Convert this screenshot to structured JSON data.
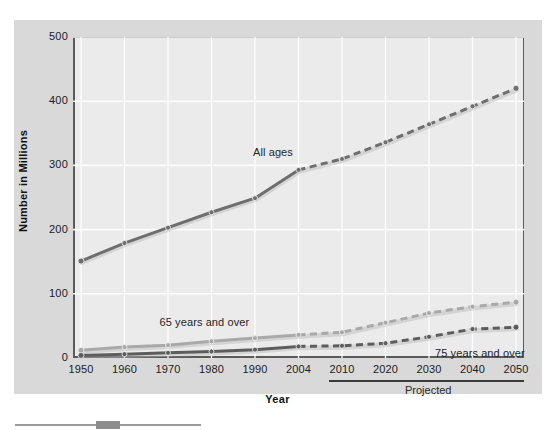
{
  "chart_data": {
    "type": "line",
    "title": "",
    "xlabel": "Year",
    "ylabel": "Number in Millions",
    "ylim": [
      0,
      500
    ],
    "yticks": [
      0,
      100,
      200,
      300,
      400,
      500
    ],
    "categories": [
      "1950",
      "1960",
      "1970",
      "1980",
      "1990",
      "2004",
      "2010",
      "2020",
      "2030",
      "2040",
      "2050"
    ],
    "grid": true,
    "legend_position": "inline-labels",
    "projection_start_category": "2010",
    "projection_note": "Projected",
    "series": [
      {
        "name": "All ages",
        "color": "#6e6e6e",
        "values": [
          151,
          179,
          203,
          227,
          249,
          293,
          310,
          336,
          364,
          392,
          420
        ],
        "label_text": "All ages"
      },
      {
        "name": "65 years and over",
        "color": "#a9a9a9",
        "values": [
          12,
          17,
          20,
          26,
          31,
          36,
          40,
          55,
          70,
          80,
          87
        ],
        "label_text": "65 years and over"
      },
      {
        "name": "75 years and over",
        "color": "#5d5d5d",
        "values": [
          4,
          6,
          8,
          10,
          13,
          18,
          19,
          23,
          33,
          45,
          48
        ],
        "label_text": "75 years and over"
      }
    ],
    "annotations": [
      {
        "text": "All ages",
        "x_category": "1990"
      },
      {
        "text": "65 years and over",
        "x_category": "1980"
      },
      {
        "text": "75 years and over",
        "x_category": "2035"
      },
      {
        "text": "Projected",
        "x_category": "2030"
      }
    ]
  },
  "axes": {
    "y_title": "Number in Millions",
    "x_title": "Year",
    "y_tick_labels": [
      "500",
      "400",
      "300",
      "200",
      "100",
      "0"
    ],
    "x_tick_labels": [
      "1950",
      "1960",
      "1970",
      "1980",
      "1990",
      "2004",
      "2010",
      "2020",
      "2030",
      "2040",
      "2050"
    ]
  },
  "labels": {
    "all_ages": "All ages",
    "sixty_five_plus": "65 years and over",
    "seventy_five_plus": "75 years and over",
    "projected": "Projected"
  },
  "colors": {
    "panel_background": "#d9d9d9",
    "plot_background": "#ebebeb",
    "axis": "#5a5a5a",
    "gridline": "#ffffff",
    "series_all_ages": "#6e6e6e",
    "series_65_plus": "#a9a9a9",
    "series_75_plus": "#5d5d5d"
  }
}
